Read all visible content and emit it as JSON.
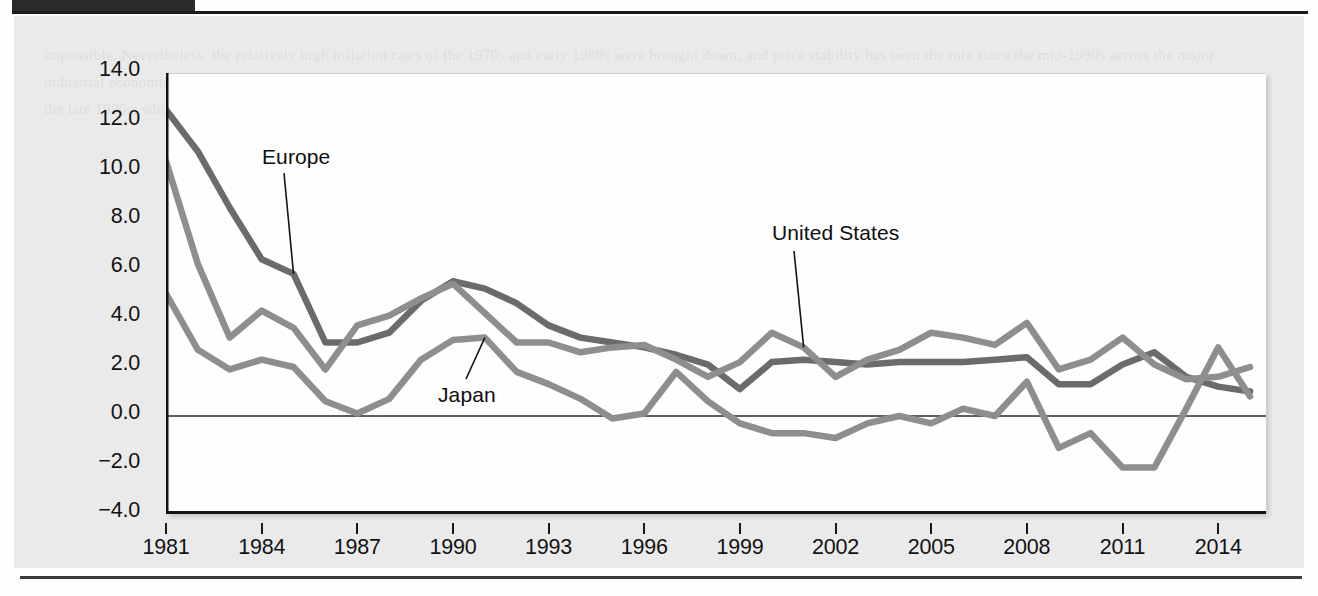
{
  "page": {
    "ghost_text": "impossible. Nevertheless, the relatively high inflation rates of the 1970s and early 1980s were brought down, and price stability has been the rule since the mid-1990s across the major industrial economies. The figure below shows annual inflation rates for the United States, Europe, and Japan since 1981. Japan has experienced outright deflation in a number of years since the late 1990s, while the United States and Europe have generally kept inflation close to 2 percent per year."
  },
  "figure": {
    "y_axis_title": "Annual Inflation (Percentage)",
    "series_labels": [
      {
        "name": "europe-label",
        "text": "Europe"
      },
      {
        "name": "japan-label",
        "text": "Japan"
      },
      {
        "name": "united-states-label",
        "text": "United States"
      }
    ]
  },
  "chart_data": {
    "type": "line",
    "title": "",
    "xlabel": "",
    "ylabel": "Annual Inflation (Percentage)",
    "xlim": [
      1981,
      2015.5
    ],
    "ylim": [
      -4.0,
      14.0
    ],
    "ytick_labels": [
      "14.0",
      "12.0",
      "10.0",
      "8.0",
      "6.0",
      "4.0",
      "2.0",
      "0.0",
      "-2.0",
      "-4.0"
    ],
    "yticks": [
      14.0,
      12.0,
      10.0,
      8.0,
      6.0,
      4.0,
      2.0,
      0.0,
      -2.0,
      -4.0
    ],
    "xtick_labels": [
      "1981",
      "1984",
      "1987",
      "1990",
      "1993",
      "1996",
      "1999",
      "2002",
      "2005",
      "2008",
      "2011",
      "2014"
    ],
    "xticks": [
      1981,
      1984,
      1987,
      1990,
      1993,
      1996,
      1999,
      2002,
      2005,
      2008,
      2011,
      2014
    ],
    "grid": false,
    "zero_line": true,
    "legend_position": "inline-annotations",
    "x": [
      1981,
      1982,
      1983,
      1984,
      1985,
      1986,
      1987,
      1988,
      1989,
      1990,
      1991,
      1992,
      1993,
      1994,
      1995,
      1996,
      1997,
      1998,
      1999,
      2000,
      2001,
      2002,
      2003,
      2004,
      2005,
      2006,
      2007,
      2008,
      2009,
      2010,
      2011,
      2012,
      2013,
      2014,
      2015
    ],
    "series": [
      {
        "name": "Europe",
        "color": "#6b6b6b",
        "values": [
          12.5,
          10.8,
          8.5,
          6.4,
          5.8,
          3.0,
          3.0,
          3.4,
          4.7,
          5.5,
          5.2,
          4.6,
          3.7,
          3.2,
          3.0,
          2.8,
          2.5,
          2.1,
          1.1,
          2.2,
          2.3,
          2.2,
          2.1,
          2.2,
          2.2,
          2.2,
          2.3,
          2.4,
          1.3,
          1.3,
          2.1,
          2.6,
          1.6,
          1.2,
          1.0
        ]
      },
      {
        "name": "United States",
        "color": "#8e8e8e",
        "values": [
          10.4,
          6.2,
          3.2,
          4.3,
          3.6,
          1.9,
          3.7,
          4.1,
          4.8,
          5.4,
          4.2,
          3.0,
          3.0,
          2.6,
          2.8,
          2.9,
          2.3,
          1.6,
          2.2,
          3.4,
          2.8,
          1.6,
          2.3,
          2.7,
          3.4,
          3.2,
          2.9,
          3.8,
          1.9,
          2.3,
          3.2,
          2.1,
          1.5,
          1.6,
          2.0
        ]
      },
      {
        "name": "Japan",
        "color": "#8e8e8e",
        "values": [
          5.0,
          2.7,
          1.9,
          2.3,
          2.0,
          0.6,
          0.1,
          0.7,
          2.3,
          3.1,
          3.2,
          1.8,
          1.3,
          0.7,
          -0.1,
          0.1,
          1.8,
          0.6,
          -0.3,
          -0.7,
          -0.7,
          -0.9,
          -0.3,
          0.0,
          -0.3,
          0.3,
          0.0,
          1.4,
          -1.3,
          -0.7,
          -2.1,
          -2.1,
          0.3,
          2.8,
          0.8
        ]
      }
    ],
    "annotations": [
      {
        "text": "Europe",
        "points_to_series": "Europe",
        "points_to_x": 1985
      },
      {
        "text": "Japan",
        "points_to_series": "Japan",
        "points_to_x": 1991
      },
      {
        "text": "United States",
        "points_to_series": "United States",
        "points_to_x": 2001
      }
    ]
  }
}
